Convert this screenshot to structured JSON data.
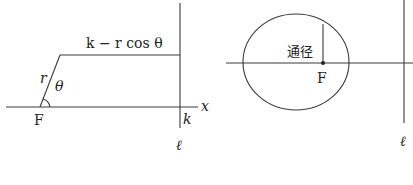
{
  "left_figure": {
    "top_segment_label": "k − r cos θ",
    "radius_label": "r",
    "angle_label": "θ",
    "focus_label": "F",
    "axis_label": "x",
    "distance_label": "k",
    "directrix_label": "ℓ"
  },
  "right_figure": {
    "latus_rectum_label": "通径",
    "focus_label": "F",
    "directrix_label": "ℓ"
  }
}
